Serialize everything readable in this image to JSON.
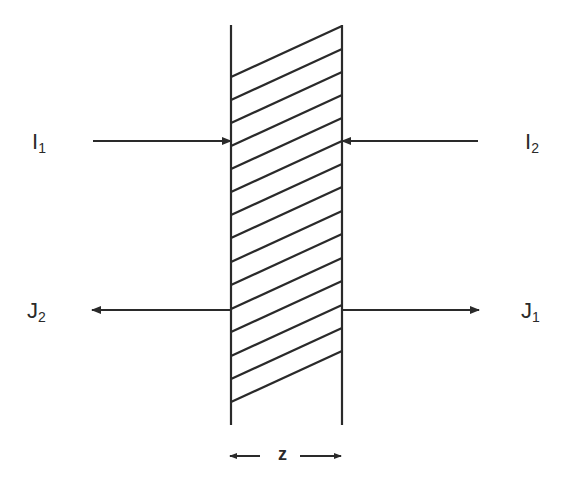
{
  "diagram": {
    "title": "",
    "slab": {
      "left_x": 231,
      "right_x": 342,
      "top_y": 25,
      "bottom_y": 425,
      "hatch_left_y": [
        77,
        100,
        123,
        146,
        169,
        192,
        215,
        238,
        262,
        285,
        309,
        332,
        356,
        379,
        402
      ],
      "hatch_rise": 51
    },
    "labels": {
      "i1": {
        "main": "I",
        "sub": "1"
      },
      "i2": {
        "main": "I",
        "sub": "2"
      },
      "j1": {
        "main": "J",
        "sub": "1"
      },
      "j2": {
        "main": "J",
        "sub": "2"
      },
      "thickness": "z"
    },
    "arrows": [
      {
        "name": "incident-flux-i1-arrow",
        "from": [
          93,
          141
        ],
        "to": [
          231,
          141
        ]
      },
      {
        "name": "incident-flux-i2-arrow",
        "from": [
          478,
          141
        ],
        "to": [
          342,
          141
        ]
      },
      {
        "name": "emergent-flux-j2-arrow",
        "from": [
          231,
          310
        ],
        "to": [
          92,
          310
        ]
      },
      {
        "name": "emergent-flux-j1-arrow",
        "from": [
          342,
          310
        ],
        "to": [
          479,
          310
        ]
      }
    ],
    "colors": {
      "stroke": "#2a2a2a",
      "background": "#ffffff"
    }
  }
}
